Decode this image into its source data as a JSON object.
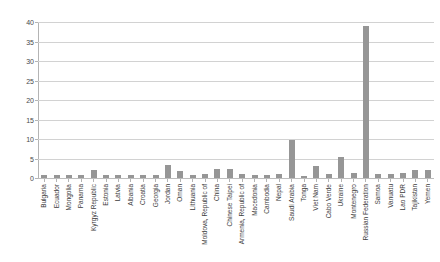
{
  "chart_data": {
    "type": "bar",
    "title": "",
    "subtitle": "",
    "xlabel": "",
    "ylabel": "",
    "ylim": [
      0,
      40
    ],
    "yticks": [
      0,
      5,
      10,
      15,
      20,
      25,
      30,
      35,
      40
    ],
    "grid": true,
    "legend": false,
    "legend_position": "none",
    "bar_color": "#969696",
    "gridline_color": "#d2d2d2",
    "axis_color": "#b4b4b4",
    "categories": [
      "Bulgaria",
      "Ecuador",
      "Mongolia",
      "Panama",
      "Kyrgyz Republic",
      "Estonia",
      "Latvia",
      "Albania",
      "Croatia",
      "Georgia",
      "Jordan",
      "Oman",
      "Lithuania",
      "Moldova, Republic of",
      "China",
      "Chinese Taipei",
      "Armenia, Republic of",
      "Macedonia",
      "Cambodia",
      "Nepal",
      "Saudi Arabia",
      "Tonga",
      "Viet Nam",
      "Cabo Verde",
      "Ukraine",
      "Montenegro",
      "Russian Federation",
      "Samoa",
      "Vanuatu",
      "Lao PDR",
      "Tajikistan",
      "Yemen"
    ],
    "values": [
      0.7,
      0.7,
      0.8,
      0.9,
      2.0,
      0.8,
      0.8,
      0.8,
      0.9,
      0.9,
      3.3,
      1.8,
      0.8,
      1.0,
      2.3,
      2.3,
      1.0,
      0.8,
      0.8,
      1.0,
      9.8,
      0.6,
      3.0,
      1.0,
      5.5,
      1.2,
      39.0,
      1.0,
      1.0,
      1.4,
      2.0,
      2.0
    ]
  }
}
